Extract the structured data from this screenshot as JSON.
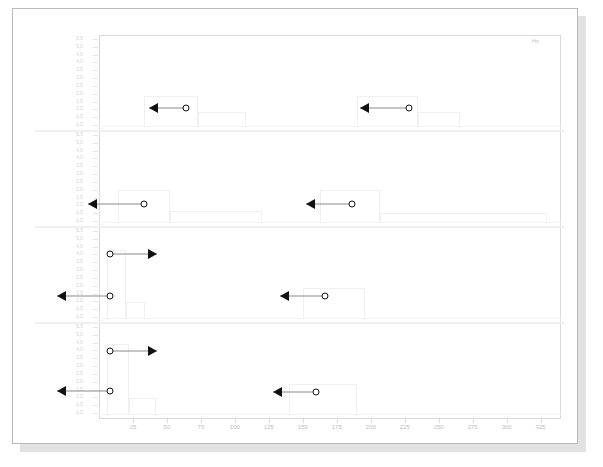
{
  "chart_data": {
    "type": "line",
    "title": "",
    "xlabel": "Hz",
    "ylabel": "",
    "xlim": [
      0,
      340
    ],
    "xticks": [
      25,
      50,
      75,
      100,
      125,
      150,
      175,
      200,
      225,
      250,
      275,
      300,
      325
    ],
    "xtick_labels": [
      "25",
      "50",
      "75",
      "100",
      "125",
      "150",
      "175",
      "200",
      "225",
      "250",
      "275",
      "300",
      "325"
    ],
    "grid": false,
    "legend": null,
    "panels": [
      {
        "name": "panel-1",
        "ylim": [
          0.0,
          5.5
        ],
        "ytick_labels": [
          "5,5",
          "5,0",
          "4,5",
          "4,0",
          "3,5",
          "3,0",
          "2,5",
          "2,0",
          "1,5",
          "1,0",
          "0,5",
          "0,0"
        ],
        "annotations": [
          {
            "marker_x": 64,
            "marker_y": 1.25,
            "arrow": "left",
            "arrow_x": 37
          },
          {
            "marker_x": 228,
            "marker_y": 1.25,
            "arrow": "left",
            "arrow_x": 192
          }
        ],
        "steps": [
          {
            "x_start": 33,
            "x_end": 73,
            "level": 1.95
          },
          {
            "x_start": 73,
            "x_end": 108,
            "level": 0.95
          },
          {
            "x_start": 190,
            "x_end": 235,
            "level": 1.95
          },
          {
            "x_start": 235,
            "x_end": 266,
            "level": 0.95
          }
        ]
      },
      {
        "name": "panel-2",
        "ylim": [
          0.0,
          5.5
        ],
        "ytick_labels": [
          "5,5",
          "5,0",
          "4,5",
          "4,0",
          "3,5",
          "3,0",
          "2,5",
          "2,0",
          "1,5",
          "1,0",
          "0,5",
          "0,0"
        ],
        "annotations": [
          {
            "marker_x": 33,
            "marker_y": 1.25,
            "arrow": "left",
            "arrow_x": -8
          },
          {
            "marker_x": 186,
            "marker_y": 1.25,
            "arrow": "left",
            "arrow_x": 152
          }
        ],
        "steps": [
          {
            "x_start": 14,
            "x_end": 52,
            "level": 2.05
          },
          {
            "x_start": 52,
            "x_end": 120,
            "level": 0.8
          },
          {
            "x_start": 163,
            "x_end": 207,
            "level": 2.05
          },
          {
            "x_start": 207,
            "x_end": 330,
            "level": 0.7
          }
        ]
      },
      {
        "name": "panel-3",
        "ylim": [
          0.0,
          5.5
        ],
        "ytick_labels": [
          "5,5",
          "5,0",
          "4,5",
          "4,0",
          "3,5",
          "3,0",
          "2,5",
          "2,0",
          "1,5",
          "1,0",
          "0,5",
          "0,0"
        ],
        "annotations": [
          {
            "marker_x": 8,
            "marker_y": 4.05,
            "arrow": "right",
            "arrow_x": 43
          },
          {
            "marker_x": 8,
            "marker_y": 1.45,
            "arrow": "left",
            "arrow_x": -31
          },
          {
            "marker_x": 166,
            "marker_y": 1.45,
            "arrow": "left",
            "arrow_x": 133
          }
        ],
        "steps": [
          {
            "x_start": 6,
            "x_end": 20,
            "level": 4.3
          },
          {
            "x_start": 20,
            "x_end": 34,
            "level": 1.1
          },
          {
            "x_start": 150,
            "x_end": 196,
            "level": 1.95
          }
        ]
      },
      {
        "name": "panel-4",
        "ylim": [
          0.0,
          5.5
        ],
        "ytick_labels": [
          "5,5",
          "5,0",
          "4,5",
          "4,0",
          "3,5",
          "3,0",
          "2,5",
          "2,0",
          "1,5",
          "1,0",
          "0,5",
          "0,0"
        ],
        "annotations": [
          {
            "marker_x": 8,
            "marker_y": 4.0,
            "arrow": "right",
            "arrow_x": 43
          },
          {
            "marker_x": 8,
            "marker_y": 1.5,
            "arrow": "left",
            "arrow_x": -31
          },
          {
            "marker_x": 160,
            "marker_y": 1.45,
            "arrow": "left",
            "arrow_x": 128
          }
        ],
        "steps": [
          {
            "x_start": 6,
            "x_end": 22,
            "level": 4.4
          },
          {
            "x_start": 22,
            "x_end": 42,
            "level": 1.1
          },
          {
            "x_start": 140,
            "x_end": 190,
            "level": 1.95
          }
        ]
      }
    ]
  },
  "colors": {
    "page_background": "#ffffff",
    "page_border": "#b9b9b9",
    "shadow": "#c9c9c9",
    "axis_text": "#bdbdbd",
    "ytick_text": "#cfcfcf",
    "panel_border": "#d9d9d9",
    "trace": "#f0f0f0",
    "marker_stroke": "#111111",
    "connector": "#8a8a8a"
  }
}
